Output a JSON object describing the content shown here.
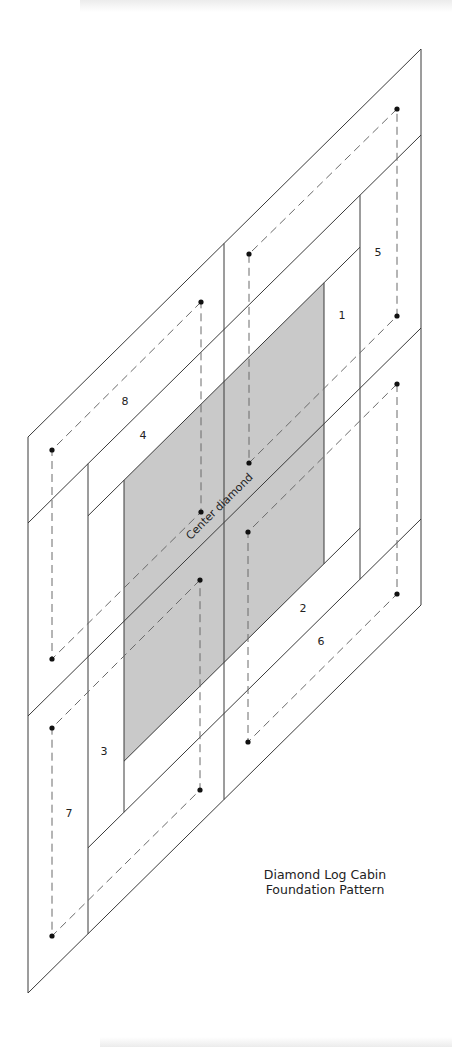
{
  "diagram": {
    "title_line1": "Diamond Log Cabin",
    "title_line2": "Foundation Pattern",
    "center_label": "Center diamond",
    "colors": {
      "center_fill": "#c9c9c9",
      "line": "#3a3a3a",
      "seam": "#6a6a6a",
      "dot": "#111111"
    },
    "piece_labels": [
      {
        "id": "1",
        "text": "1",
        "x": 342,
        "y": 316
      },
      {
        "id": "2",
        "text": "2",
        "x": 303,
        "y": 609
      },
      {
        "id": "3",
        "text": "3",
        "x": 104,
        "y": 752
      },
      {
        "id": "4",
        "text": "4",
        "x": 143,
        "y": 436
      },
      {
        "id": "5",
        "text": "5",
        "x": 378,
        "y": 253
      },
      {
        "id": "6",
        "text": "6",
        "x": 321,
        "y": 642
      },
      {
        "id": "7",
        "text": "7",
        "x": 69,
        "y": 814
      },
      {
        "id": "8",
        "text": "8",
        "x": 125,
        "y": 402
      }
    ],
    "sections": [
      {
        "name": "top-right",
        "seam_points": [
          [
            397,
            109
          ],
          [
            249,
            254
          ],
          [
            249,
            463
          ],
          [
            397,
            316
          ]
        ]
      },
      {
        "name": "top-left",
        "seam_points": [
          [
            201,
            302
          ],
          [
            52,
            450
          ],
          [
            52,
            659
          ],
          [
            201,
            512
          ]
        ]
      },
      {
        "name": "bottom-right",
        "seam_points": [
          [
            397,
            384
          ],
          [
            248,
            532
          ],
          [
            248,
            742
          ],
          [
            397,
            594
          ]
        ]
      },
      {
        "name": "bottom-left",
        "seam_points": [
          [
            200,
            580
          ],
          [
            52,
            728
          ],
          [
            52,
            936
          ],
          [
            200,
            790
          ]
        ]
      }
    ]
  }
}
